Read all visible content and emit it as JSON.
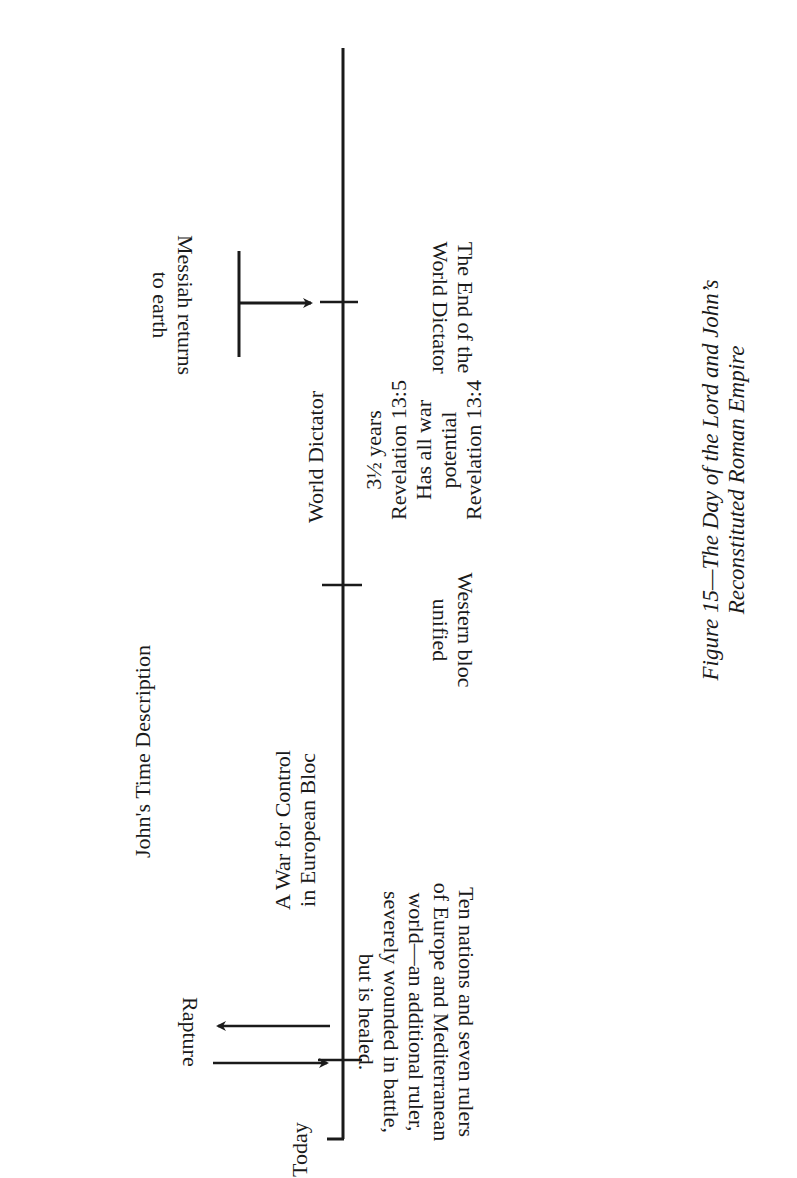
{
  "header": {
    "title": "John's Time Description"
  },
  "timeline": {
    "start_label": "Today",
    "periods": [
      {
        "label_lines": [
          "A War for Control",
          "in European Bloc"
        ]
      },
      {
        "label_lines": [
          "World Dictator"
        ]
      }
    ],
    "events": [
      {
        "name": "Rapture",
        "description_lines": [
          "Ten nations and seven rulers",
          "of Europe and Mediterranean",
          "world—an additional ruler,",
          "severely wounded in battle,",
          "but is healed."
        ]
      },
      {
        "name": "Western bloc unified",
        "description_lines": [
          "Western bloc",
          "unified"
        ]
      },
      {
        "name": "End of World Dictator",
        "description_lines": [
          "The End of the",
          "World Dictator"
        ]
      }
    ],
    "dictator_details": [
      "3½  years",
      "Revelation 13:5",
      "Has all war",
      "potential",
      "Revelation 13:4"
    ],
    "messiah": {
      "label_lines": [
        "Messiah returns",
        "to earth"
      ]
    },
    "rapture_label": "Rapture"
  },
  "caption": {
    "lines": [
      "Figure 15—The Day of the Lord and John’s",
      "Reconstituted Roman Empire"
    ]
  }
}
